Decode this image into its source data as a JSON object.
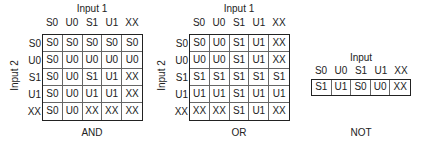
{
  "tables": {
    "and": {
      "x_axis_label": "Input 1",
      "y_axis_label": "Input 2",
      "caption": "AND",
      "columns": [
        "S0",
        "U0",
        "S1",
        "U1",
        "XX"
      ],
      "rows": [
        "S0",
        "U0",
        "S1",
        "U1",
        "XX"
      ],
      "cells": [
        [
          "S0",
          "S0",
          "S0",
          "S0",
          "S0"
        ],
        [
          "S0",
          "U0",
          "U0",
          "U0",
          "U0"
        ],
        [
          "S0",
          "U0",
          "S1",
          "U1",
          "XX"
        ],
        [
          "S0",
          "U0",
          "U1",
          "U1",
          "XX"
        ],
        [
          "S0",
          "U0",
          "XX",
          "XX",
          "XX"
        ]
      ]
    },
    "or": {
      "x_axis_label": "Input 1",
      "y_axis_label": "Input 2",
      "caption": "OR",
      "columns": [
        "S0",
        "U0",
        "S1",
        "U1",
        "XX"
      ],
      "rows": [
        "S0",
        "U0",
        "S1",
        "U1",
        "XX"
      ],
      "cells": [
        [
          "S0",
          "U0",
          "S1",
          "U1",
          "XX"
        ],
        [
          "U0",
          "U0",
          "S1",
          "U1",
          "XX"
        ],
        [
          "S1",
          "S1",
          "S1",
          "S1",
          "S1"
        ],
        [
          "U1",
          "U1",
          "S1",
          "U1",
          "U1"
        ],
        [
          "XX",
          "XX",
          "S1",
          "U1",
          "XX"
        ]
      ]
    },
    "not": {
      "x_axis_label": "Input",
      "caption": "NOT",
      "columns": [
        "S0",
        "U0",
        "S1",
        "U1",
        "XX"
      ],
      "cells": [
        [
          "S1",
          "U1",
          "S0",
          "U0",
          "XX"
        ]
      ]
    }
  }
}
